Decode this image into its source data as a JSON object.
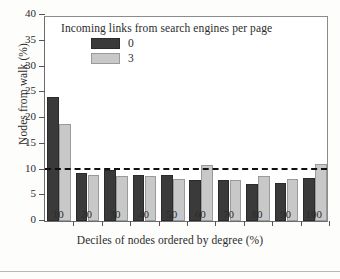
{
  "chart_data": {
    "type": "bar",
    "title": "",
    "subtitle": "",
    "xlabel": "Deciles of nodes ordered by degree (%)",
    "ylabel": "Nodes from walk (%)",
    "categories": [
      "10",
      "20",
      "30",
      "40",
      "50",
      "60",
      "70",
      "80",
      "90",
      "100"
    ],
    "series": [
      {
        "name": "0",
        "color": "#3a3a3a",
        "values": [
          24.1,
          9.4,
          10.0,
          9.0,
          8.9,
          7.9,
          7.9,
          7.1,
          7.4,
          8.4
        ]
      },
      {
        "name": "3",
        "color": "#c8c8c8",
        "values": [
          18.9,
          9.0,
          8.8,
          8.7,
          8.2,
          10.8,
          8.0,
          8.7,
          8.2,
          11.0
        ]
      }
    ],
    "ylim": [
      0,
      40
    ],
    "yticks": [
      "0",
      "5",
      "10",
      "15",
      "20",
      "25",
      "30",
      "35",
      "40"
    ],
    "xticks": [
      "10",
      "20",
      "30",
      "40",
      "50",
      "60",
      "70",
      "80",
      "90",
      "100"
    ],
    "grid": false,
    "legend": {
      "position": "upper-center",
      "title": "Incoming links from search engines per page",
      "entries": [
        {
          "label": "0",
          "color": "#3a3a3a"
        },
        {
          "label": "3",
          "color": "#c8c8c8"
        }
      ]
    },
    "annotations": [
      {
        "type": "hline",
        "value": 10,
        "style": "dashed",
        "color": "#111111"
      }
    ]
  }
}
